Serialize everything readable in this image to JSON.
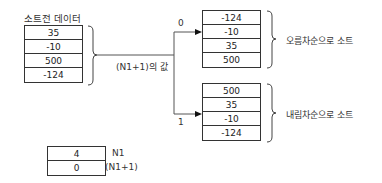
{
  "source_table": {
    "title": "소트전 데이터",
    "values": [
      "35",
      "-10",
      "500",
      "-124"
    ]
  },
  "selector_label": "(N1+1)의 값",
  "branch_ascending": {
    "condition": "0",
    "values": [
      "-124",
      "-10",
      "35",
      "500"
    ],
    "label": "오름차순으로 소트"
  },
  "branch_descending": {
    "condition": "1",
    "values": [
      "500",
      "35",
      "-10",
      "-124"
    ],
    "label": "내림차순으로 소트"
  },
  "params_table": {
    "rows": [
      {
        "value": "4",
        "label": "N1"
      },
      {
        "value": "0",
        "label": "(N1+1)"
      }
    ]
  }
}
